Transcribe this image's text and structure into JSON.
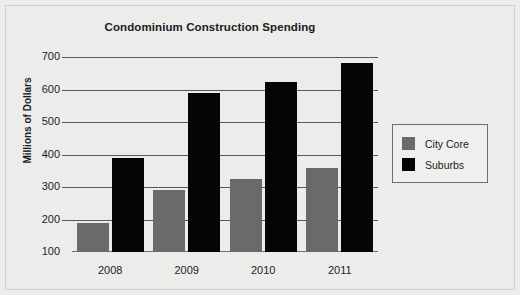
{
  "chart_data": {
    "type": "bar",
    "title": "Condominium Construction Spending",
    "xlabel": "",
    "ylabel": "Millions of Dollars",
    "categories": [
      "2008",
      "2009",
      "2010",
      "2011"
    ],
    "series": [
      {
        "name": "City Core",
        "color": "#6a6a6a",
        "values": [
          188,
          290,
          325,
          360
        ]
      },
      {
        "name": "Suburbs",
        "color": "#050505",
        "values": [
          390,
          588,
          622,
          682
        ]
      }
    ],
    "ylim": [
      100,
      700
    ],
    "ytick_step": 100,
    "yticks": [
      "700",
      "600",
      "500",
      "400",
      "300",
      "200",
      "100"
    ],
    "grid": true,
    "legend_position": "right",
    "legend": [
      "City Core",
      "Suburbs"
    ],
    "background_color": "#ececeb"
  },
  "legend": {
    "items": [
      {
        "label": "City Core"
      },
      {
        "label": "Suburbs"
      }
    ]
  }
}
